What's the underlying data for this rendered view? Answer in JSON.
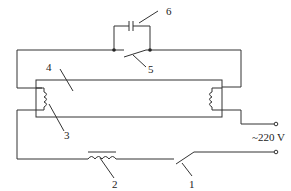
{
  "diagram": {
    "labels": {
      "l1": "1",
      "l2": "2",
      "l3": "3",
      "l4": "4",
      "l5": "5",
      "l6": "6",
      "supply": "~220 V"
    },
    "components": [
      {
        "id": "1",
        "name": "switch"
      },
      {
        "id": "2",
        "name": "ballast"
      },
      {
        "id": "3",
        "name": "filament"
      },
      {
        "id": "4",
        "name": "lamp-tube"
      },
      {
        "id": "5",
        "name": "starter-switch"
      },
      {
        "id": "6",
        "name": "capacitor"
      }
    ],
    "colors": {
      "line": "#333333",
      "background": "#ffffff"
    }
  }
}
